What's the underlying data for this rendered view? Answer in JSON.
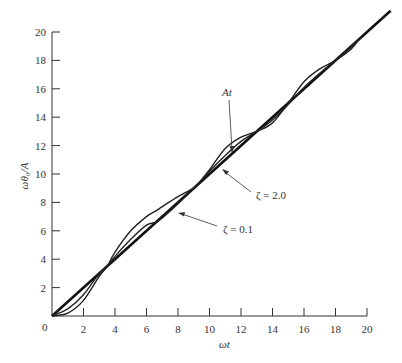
{
  "chart_data": {
    "type": "line",
    "title": "",
    "xlabel": "ωt",
    "ylabel": "ωθ₀/A",
    "xlim": [
      0,
      20
    ],
    "ylim": [
      0,
      20
    ],
    "grid": false,
    "x_ticks": [
      0,
      2,
      4,
      6,
      8,
      10,
      12,
      14,
      16,
      18,
      20
    ],
    "y_ticks": [
      2,
      4,
      6,
      8,
      10,
      12,
      14,
      16,
      18,
      20
    ],
    "x_tick_labels": [
      "0",
      "2",
      "4",
      "6",
      "8",
      "10",
      "12",
      "14",
      "16",
      "18",
      "20"
    ],
    "y_tick_labels": [
      "2",
      "4",
      "6",
      "8",
      "10",
      "12",
      "14",
      "16",
      "18",
      "20"
    ],
    "series": [
      {
        "name": "At",
        "style": "thick straight line",
        "x": [
          0,
          21.5
        ],
        "y": [
          0,
          21.5
        ]
      },
      {
        "name": "ζ = 0.1",
        "style": "oscillating about At, larger amplitude",
        "x": [
          0,
          1,
          2,
          3,
          3.5,
          4,
          5,
          6,
          6.6,
          7,
          8,
          9,
          9.2,
          10,
          11,
          12,
          13,
          14,
          15,
          16,
          17,
          18,
          19,
          19.5
        ],
        "y": [
          0,
          0.2,
          1.1,
          2.8,
          3.5,
          4.5,
          6.0,
          7.0,
          7.4,
          7.7,
          8.4,
          9.0,
          9.2,
          10.3,
          11.8,
          12.6,
          13.0,
          13.6,
          15.0,
          16.5,
          17.4,
          18.0,
          18.8,
          19.5
        ]
      },
      {
        "name": "ζ = 2.0",
        "style": "oscillating about At, smaller amplitude",
        "x": [
          0,
          1,
          2,
          3,
          3.5,
          4,
          5,
          6,
          6.6,
          7,
          8,
          9,
          9.2,
          10,
          11,
          12,
          13,
          14,
          15,
          16,
          17,
          18,
          19,
          19.5
        ],
        "y": [
          0,
          0.5,
          1.5,
          3.0,
          3.5,
          4.2,
          5.4,
          6.4,
          6.6,
          6.9,
          7.9,
          9.0,
          9.2,
          10.2,
          11.3,
          12.3,
          13.0,
          13.8,
          14.9,
          16.1,
          17.1,
          18.0,
          19.0,
          19.5
        ]
      }
    ],
    "annotations": [
      {
        "text": "At",
        "arrow_to": [
          11.3,
          11.2
        ]
      },
      {
        "text": "ζ = 2.0",
        "arrow_to": [
          10.6,
          9.9
        ]
      },
      {
        "text": "ζ = 0.1",
        "arrow_to": [
          7.9,
          7.3
        ]
      }
    ]
  },
  "labels": {
    "xlabel": "ωt",
    "ylabel": "ωθ₀/A",
    "ann_at": "At",
    "ann_z2": "ζ = 2.0",
    "ann_z01": "ζ = 0.1",
    "origin": "0"
  }
}
